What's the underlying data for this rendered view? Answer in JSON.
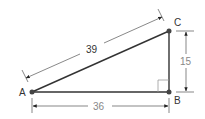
{
  "diagram": {
    "type": "right-triangle",
    "vertices": [
      {
        "label": "A"
      },
      {
        "label": "B"
      },
      {
        "label": "C"
      }
    ],
    "sides": {
      "hypotenuse_AC": "39",
      "base_AB": "36",
      "height_BC": "15"
    },
    "right_angle_at": "B",
    "colors": {
      "line": "#333333",
      "dimension_line": "#555555",
      "vertex": "#444444"
    }
  }
}
